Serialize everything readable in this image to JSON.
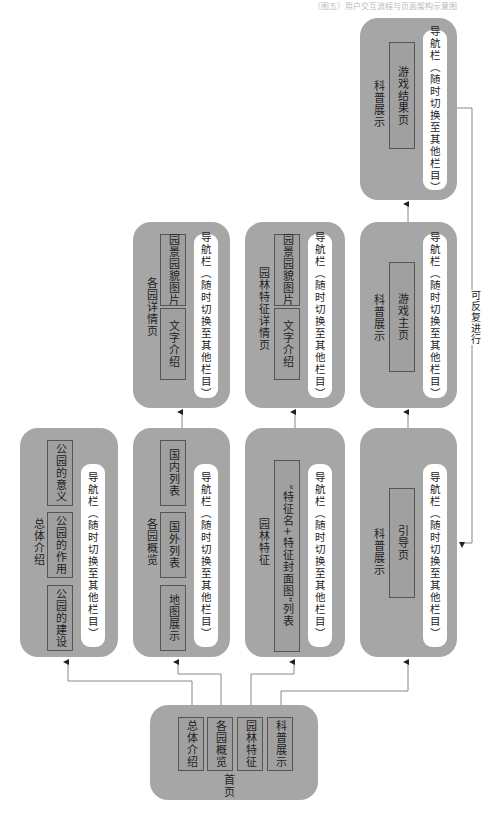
{
  "header": {
    "text": "（图五）用户交互流程与页面架构示意图"
  },
  "nav_label": "导航栏（随时切换至其他栏目）",
  "loop_label": "可反复进行",
  "home": {
    "title": "首页",
    "items": [
      "总体介绍",
      "各园概览",
      "园林特征",
      "科普展示"
    ]
  },
  "overview": {
    "title": "总体介绍",
    "items": [
      "公园的建设",
      "公园的作用",
      "公园的意义"
    ]
  },
  "gardens": {
    "title": "各园概览",
    "items": [
      "地图展示",
      "国外列表",
      "国内列表"
    ]
  },
  "garden_detail": {
    "title": "各园详情页",
    "items": [
      "文字介绍",
      "园景园貌图片"
    ]
  },
  "features": {
    "title": "园林特征",
    "items": [
      "“特征名+特征封面图”列表"
    ]
  },
  "feature_detail": {
    "title": "园林特征详情页",
    "items": [
      "文字介绍",
      "园景园貌图片"
    ]
  },
  "science_guide": {
    "title": "科普展示",
    "items": [
      "引导页"
    ]
  },
  "science_game": {
    "title": "科普展示",
    "items": [
      "游戏主页"
    ]
  },
  "science_result": {
    "title": "科普展示",
    "items": [
      "游戏结果页"
    ]
  },
  "colors": {
    "box": "#a6a6a6",
    "nav": "#ffffff",
    "line": "#888888"
  }
}
